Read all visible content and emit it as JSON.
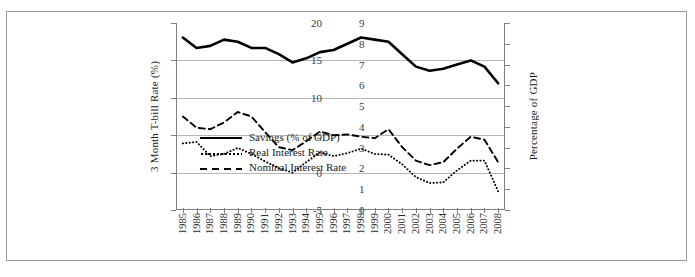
{
  "chart_data": {
    "type": "line",
    "title": "",
    "xlabel": "",
    "ylabel": "3 Month T-bill Rate (%)",
    "y2label": "Percentage of GDP",
    "ylim": [
      -5,
      20
    ],
    "y2lim": [
      0,
      9
    ],
    "yticks": [
      "20",
      "15",
      "10",
      "5",
      "0",
      "-5"
    ],
    "y2ticks": [
      "9",
      "8",
      "7",
      "6",
      "5",
      "4",
      "3",
      "2",
      "1",
      "0"
    ],
    "grid": true,
    "legend_position": "inside-lower-left",
    "categories": [
      "1985",
      "1986",
      "1987",
      "1988",
      "1989",
      "1990",
      "1991",
      "1992",
      "1993",
      "1994",
      "1995",
      "1996",
      "1997",
      "1998",
      "1999",
      "2000",
      "2001",
      "2002",
      "2003",
      "2004",
      "2005",
      "2006",
      "2007",
      "2008"
    ],
    "series": [
      {
        "name": "Savings (% of GDP)",
        "axis": "right",
        "style": "solid",
        "values": [
          8.3,
          7.8,
          7.9,
          8.2,
          8.1,
          7.8,
          7.8,
          7.5,
          7.1,
          7.3,
          7.6,
          7.7,
          8.0,
          8.3,
          8.2,
          8.1,
          7.5,
          6.9,
          6.7,
          6.8,
          7.0,
          7.2,
          6.9,
          6.1
        ]
      },
      {
        "name": "Real Interest Rate",
        "axis": "left",
        "style": "dotted",
        "values": [
          3.9,
          4.1,
          2.2,
          2.5,
          3.3,
          2.5,
          1.5,
          0.6,
          0.0,
          1.4,
          2.7,
          2.2,
          2.6,
          3.2,
          2.5,
          2.4,
          1.1,
          -0.6,
          -1.4,
          -1.3,
          0.3,
          1.6,
          1.6,
          -2.5
        ]
      },
      {
        "name": "Nominal Interest Rate",
        "axis": "left",
        "style": "dashed",
        "values": [
          7.5,
          6.0,
          5.8,
          6.7,
          8.1,
          7.5,
          5.4,
          3.4,
          3.0,
          4.2,
          5.5,
          5.0,
          5.1,
          4.8,
          4.6,
          5.8,
          3.4,
          1.6,
          1.0,
          1.4,
          3.2,
          4.8,
          4.4,
          1.4
        ]
      }
    ]
  },
  "axes": {
    "left_title": "3 Month T-bill Rate (%)",
    "right_title": "Percentage of GDP"
  },
  "legend": {
    "items": [
      {
        "label": "Savings (% of GDP)",
        "style": "solid"
      },
      {
        "label": "Real Interest Rate",
        "style": "dotted"
      },
      {
        "label": "Nominal Interest Rate",
        "style": "dashed"
      }
    ]
  }
}
